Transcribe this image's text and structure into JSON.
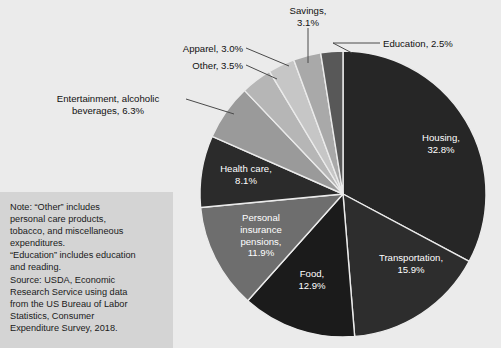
{
  "background_color": "#ebebeb",
  "chart_data": {
    "type": "pie",
    "title": "",
    "start_angle_deg": 0,
    "direction": "clockwise",
    "center": {
      "x": 343,
      "y": 194
    },
    "radius": 143,
    "categories": [
      "Housing",
      "Transportation",
      "Food",
      "Personal insurance pensions",
      "Health care",
      "Entertainment, alcoholic beverages",
      "Other",
      "Apparel",
      "Savings",
      "Education"
    ],
    "values": [
      32.8,
      15.9,
      12.9,
      11.9,
      8.1,
      6.3,
      3.5,
      3.0,
      3.1,
      2.5
    ],
    "unit": "%",
    "slice_colors": [
      "#262626",
      "#2d2d2d",
      "#1b1b1b",
      "#6e6e6e",
      "#2b2b2b",
      "#9a9a9a",
      "#b6b6b6",
      "#c6c6c6",
      "#a9a9a9",
      "#585858"
    ],
    "slice_border_color": "#ebebeb",
    "legend": "none",
    "grid": false
  },
  "inside_labels": [
    {
      "name": "housing",
      "text": "Housing,\n32.8%",
      "x": 402,
      "y": 132,
      "width": 78
    },
    {
      "name": "transportation",
      "text": "Transportation,\n15.9%",
      "x": 363,
      "y": 252,
      "width": 96
    },
    {
      "name": "food",
      "text": "Food,\n12.9%",
      "x": 284,
      "y": 268,
      "width": 56
    },
    {
      "name": "personal-insurance-pensions",
      "text": "Personal\ninsurance\npensions,\n11.9%",
      "x": 222,
      "y": 212,
      "width": 78
    },
    {
      "name": "health-care",
      "text": "Health care,\n8.1%",
      "x": 209,
      "y": 163,
      "width": 74
    }
  ],
  "callouts": [
    {
      "name": "savings",
      "text": "Savings,\n3.1%",
      "x": 277,
      "y": 5,
      "width": 62,
      "align": "center-align"
    },
    {
      "name": "education",
      "text": "Education, 2.5%",
      "x": 383,
      "y": 38,
      "width": 92,
      "align": "left-align"
    },
    {
      "name": "apparel",
      "text": "Apparel, 3.0%",
      "x": 163,
      "y": 43,
      "width": 80,
      "align": "right-align"
    },
    {
      "name": "other",
      "text": "Other, 3.5%",
      "x": 160,
      "y": 60,
      "width": 83,
      "align": "right-align"
    },
    {
      "name": "entertainment",
      "text": "Entertainment, alcoholic\nbeverages, 6.3%",
      "x": 33,
      "y": 93,
      "width": 150,
      "align": "center-align"
    }
  ],
  "leader_lines": [
    {
      "name": "savings-leader",
      "x1": 308,
      "y1": 28,
      "x2": 308,
      "y2": 63
    },
    {
      "name": "education-leader",
      "x1": 333,
      "y1": 43,
      "x2": 380,
      "y2": 43
    },
    {
      "name": "education-leader-diag",
      "x1": 333,
      "y1": 43,
      "x2": 352,
      "y2": 53
    },
    {
      "name": "apparel-leader",
      "x1": 246,
      "y1": 48,
      "x2": 289,
      "y2": 66
    },
    {
      "name": "other-leader",
      "x1": 246,
      "y1": 65,
      "x2": 277,
      "y2": 79
    },
    {
      "name": "entertainment-leader",
      "x1": 186,
      "y1": 99,
      "x2": 234,
      "y2": 114
    }
  ],
  "note": {
    "panel_color": "#d4d4d4",
    "lines": [
      "Note: “Other” includes",
      "personal care products,",
      "tobacco, and miscellaneous",
      "expenditures.",
      "“Education” includes education",
      "and reading.",
      "Source: USDA, Economic",
      "Research Service using data",
      "from the US Bureau of Labor",
      "Statistics, Consumer",
      "Expenditure Survey, 2018."
    ]
  }
}
